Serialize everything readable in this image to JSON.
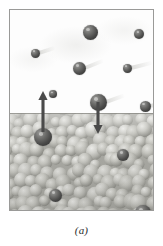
{
  "figure": {
    "caption": "(a)",
    "alt_description": "A rectangular framed panel: the upper half is white vapor containing scattered dark spheres (gas-phase molecules), the lower half is a densely packed mass of pale spheres representing liquid. An up arrow shows a molecule escaping the liquid (evaporation) and a down arrow shows a molecule entering the liquid (condensation)."
  },
  "panel": {
    "frame_color": "#9a9a98",
    "vapor_label": "vapor",
    "liquid_label": "liquid",
    "vapor_background": "#fdfdfd",
    "liquid_background": "#bdbdb8",
    "surface_y": 103
  },
  "colors": {
    "molecule_dark": "#4a4a49",
    "molecule_highlight": "#9a9a98",
    "liquid_sphere": "#c9c9c4",
    "liquid_sphere_shadow": "#8e8e89",
    "arrow": "#4a4a4a",
    "caption_text": "#2b2b2b",
    "streak": "#d6d6d3"
  },
  "arrows": [
    {
      "id": "evaporation-arrow",
      "label": "evaporation",
      "direction": "up",
      "x": 33,
      "from_y": 122,
      "to_y": 81,
      "color": "#4a4a4a"
    },
    {
      "id": "condensation-arrow",
      "label": "condensation",
      "direction": "down",
      "x": 88,
      "from_y": 92,
      "to_y": 124,
      "color": "#4a4a4a"
    }
  ],
  "molecules": {
    "vapor": [
      {
        "id": "vapor-molecule-1",
        "x": 80,
        "y": 22,
        "d": 15,
        "streak_angle": 0,
        "streak_len": 0
      },
      {
        "id": "vapor-molecule-2",
        "x": 129,
        "y": 24,
        "d": 10,
        "streak_angle": 0,
        "streak_len": 0
      },
      {
        "id": "vapor-molecule-3",
        "x": 25,
        "y": 43,
        "d": 9,
        "streak_angle": -18,
        "streak_len": 17
      },
      {
        "id": "vapor-molecule-4",
        "x": 69,
        "y": 58,
        "d": 13,
        "streak_angle": -22,
        "streak_len": 20
      },
      {
        "id": "vapor-molecule-5",
        "x": 117,
        "y": 58,
        "d": 9,
        "streak_angle": -14,
        "streak_len": 22
      },
      {
        "id": "vapor-molecule-6",
        "x": 43,
        "y": 84,
        "d": 8,
        "streak_angle": 0,
        "streak_len": 0
      },
      {
        "id": "vapor-molecule-7",
        "x": 88,
        "y": 92,
        "d": 17,
        "streak_angle": -20,
        "streak_len": 20
      },
      {
        "id": "vapor-molecule-8",
        "x": 135,
        "y": 96,
        "d": 11,
        "streak_angle": -12,
        "streak_len": 18
      }
    ],
    "liquid": [
      {
        "id": "liquid-molecule-1",
        "x": 33,
        "y": 127,
        "d": 18
      },
      {
        "id": "liquid-molecule-2",
        "x": 113,
        "y": 145,
        "d": 12
      },
      {
        "id": "liquid-molecule-3",
        "x": 45,
        "y": 185,
        "d": 13
      },
      {
        "id": "liquid-molecule-4",
        "x": 133,
        "y": 203,
        "d": 16
      }
    ]
  }
}
